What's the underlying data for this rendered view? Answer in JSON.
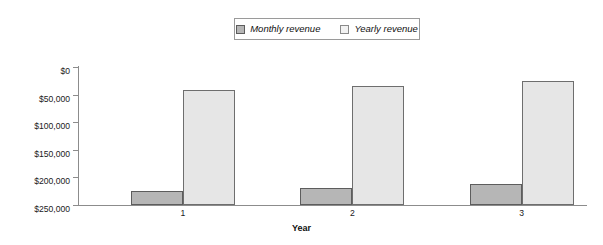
{
  "chart_data": {
    "type": "bar",
    "title": "",
    "subtitle": "",
    "xlabel": "Year",
    "ylabel": "",
    "categories": [
      "1",
      "2",
      "3"
    ],
    "series": [
      {
        "name": "Monthly revenue",
        "values": [
          25000,
          30000,
          38000
        ],
        "color": "#b6b6b6",
        "border": "#5d5d5d"
      },
      {
        "name": "Yearly revenue",
        "values": [
          208000,
          215000,
          224000
        ],
        "color": "#e6e6e6",
        "border": "#6e6e6e"
      }
    ],
    "ylim": [
      0,
      250000
    ],
    "ytick_values": [
      0,
      50000,
      100000,
      150000,
      200000,
      250000
    ],
    "ytick_labels": [
      "$0",
      "$50,000",
      "$100,000",
      "$150,000",
      "$200,000",
      "$250,000"
    ],
    "grid": false,
    "legend_position": "top-center",
    "legend_border": true,
    "background": "#ffffff",
    "axis_color": "#8c8c8c"
  },
  "legend": {
    "items": [
      {
        "label": "Monthly revenue",
        "swatch_name": "legend-swatch-monthly"
      },
      {
        "label": "Yearly revenue",
        "swatch_name": "legend-swatch-yearly"
      }
    ]
  },
  "axes": {
    "x_title": "Year",
    "x_labels": [
      "1",
      "2",
      "3"
    ],
    "y_labels": [
      "$250,000",
      "$200,000",
      "$150,000",
      "$100,000",
      "$50,000",
      "$0"
    ]
  }
}
